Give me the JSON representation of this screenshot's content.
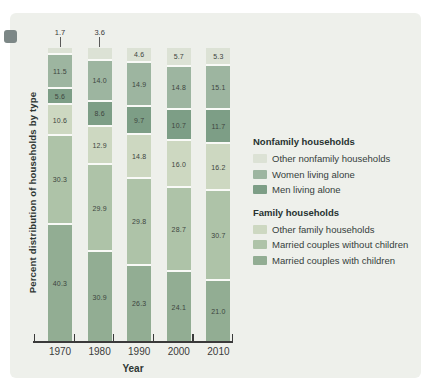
{
  "figure": {
    "y_axis_label": "Percent distribution of households by type",
    "x_axis_label": "Year",
    "panel_bg": "#eef0eb",
    "corner_tab_color": "#7c8786"
  },
  "legend": {
    "groups": [
      {
        "header": "Nonfamily households",
        "items": [
          {
            "label": "Other nonfamily households",
            "color": "#dce2d5"
          },
          {
            "label": "Women living alone",
            "color": "#9db5a0"
          },
          {
            "label": "Men living alone",
            "color": "#7d9e86"
          }
        ]
      },
      {
        "header": "Family households",
        "items": [
          {
            "label": "Other family households",
            "color": "#cdd8c1"
          },
          {
            "label": "Married couples without children",
            "color": "#aec3a8"
          },
          {
            "label": "Married couples with children",
            "color": "#92ad93"
          }
        ]
      }
    ]
  },
  "chart_data": {
    "type": "bar",
    "stacked": true,
    "unit": "percent",
    "title": "",
    "xlabel": "Year",
    "ylabel": "Percent distribution of households by type",
    "ylim": [
      0,
      100
    ],
    "grid": false,
    "legend_position": "right",
    "categories": [
      "1970",
      "1980",
      "1990",
      "2000",
      "2010"
    ],
    "series": [
      {
        "name": "Other nonfamily households",
        "group": "Nonfamily households",
        "color": "#dce2d5",
        "values": [
          1.7,
          3.6,
          4.6,
          5.7,
          5.3
        ]
      },
      {
        "name": "Women living alone",
        "group": "Nonfamily households",
        "color": "#9db5a0",
        "values": [
          11.5,
          14.0,
          14.9,
          14.8,
          15.1
        ]
      },
      {
        "name": "Men living alone",
        "group": "Nonfamily households",
        "color": "#7d9e86",
        "values": [
          5.6,
          8.6,
          9.7,
          10.7,
          11.7
        ]
      },
      {
        "name": "Other family households",
        "group": "Family households",
        "color": "#cdd8c1",
        "values": [
          10.6,
          12.9,
          14.8,
          16.0,
          16.2
        ]
      },
      {
        "name": "Married couples without children",
        "group": "Family households",
        "color": "#aec3a8",
        "values": [
          30.3,
          29.9,
          29.8,
          28.7,
          30.7
        ]
      },
      {
        "name": "Married couples with children",
        "group": "Family households",
        "color": "#92ad93",
        "values": [
          40.3,
          30.9,
          26.3,
          24.1,
          21.0
        ]
      }
    ],
    "callout_labels_above_bar": [
      "1970",
      "1980"
    ],
    "stack_order_top_to_bottom": [
      "Other nonfamily households",
      "Women living alone",
      "Men living alone",
      "Other family households",
      "Married couples without children",
      "Married couples with children"
    ]
  }
}
